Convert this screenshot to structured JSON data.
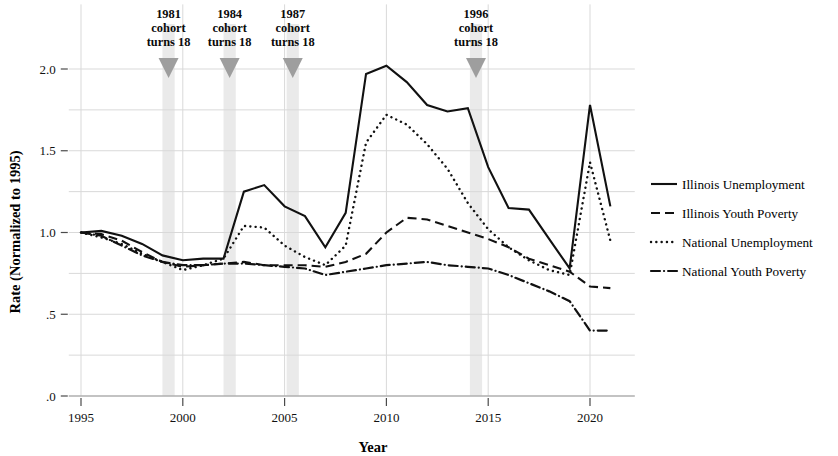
{
  "chart_data": {
    "type": "line",
    "title": "",
    "xlabel": "Year",
    "ylabel": "Rate (Normalized to 1995)",
    "xlim": [
      1994.4,
      2022.2
    ],
    "ylim": [
      0.0,
      2.12
    ],
    "grid": true,
    "legend_position": "right",
    "x_ticks": [
      "1995",
      "2000",
      "2005",
      "2010",
      "2015",
      "2020"
    ],
    "x_tick_values": [
      1995,
      2000,
      2005,
      2010,
      2015,
      2020
    ],
    "y_ticks": [
      ".0",
      ".5",
      "1.0",
      "1.5",
      "2.0"
    ],
    "y_tick_values": [
      0.0,
      0.5,
      1.0,
      1.5,
      2.0
    ],
    "y_gridline_values": [
      0.0,
      0.25,
      0.5,
      0.75,
      1.0,
      1.25,
      1.5,
      1.75,
      2.0
    ],
    "x": [
      1995,
      1996,
      1997,
      1998,
      1999,
      2000,
      2001,
      2002,
      2003,
      2004,
      2005,
      2006,
      2007,
      2008,
      2009,
      2010,
      2011,
      2012,
      2013,
      2014,
      2015,
      2016,
      2017,
      2018,
      2019,
      2020,
      2021
    ],
    "series": [
      {
        "name": "Illinois Unemployment",
        "style": "solid",
        "values": [
          1.0,
          1.01,
          0.98,
          0.93,
          0.86,
          0.83,
          0.84,
          0.84,
          1.25,
          1.29,
          1.16,
          1.1,
          0.91,
          1.12,
          1.97,
          2.02,
          1.92,
          1.78,
          1.74,
          1.76,
          1.4,
          1.15,
          1.14,
          0.96,
          0.78,
          1.78,
          1.16
        ]
      },
      {
        "name": "Illinois Youth Poverty",
        "style": "dashed",
        "values": [
          1.0,
          0.99,
          0.95,
          0.88,
          0.82,
          0.79,
          0.8,
          0.81,
          0.82,
          0.8,
          0.8,
          0.8,
          0.79,
          0.82,
          0.87,
          1.0,
          1.09,
          1.08,
          1.04,
          1.0,
          0.96,
          0.91,
          0.84,
          0.8,
          0.76,
          0.67,
          0.66
        ]
      },
      {
        "name": "National Unemployment",
        "style": "dotted",
        "values": [
          1.0,
          0.97,
          0.93,
          0.87,
          0.82,
          0.77,
          0.8,
          0.84,
          1.04,
          1.03,
          0.92,
          0.85,
          0.8,
          0.92,
          1.55,
          1.72,
          1.66,
          1.54,
          1.39,
          1.18,
          1.02,
          0.91,
          0.83,
          0.77,
          0.74,
          1.43,
          0.95
        ]
      },
      {
        "name": "National Youth Poverty",
        "style": "dashdot",
        "values": [
          1.0,
          0.98,
          0.92,
          0.86,
          0.82,
          0.8,
          0.8,
          0.81,
          0.81,
          0.8,
          0.79,
          0.78,
          0.74,
          0.76,
          0.78,
          0.8,
          0.81,
          0.82,
          0.8,
          0.79,
          0.78,
          0.74,
          0.69,
          0.64,
          0.58,
          0.4,
          0.4
        ]
      }
    ],
    "annotations": [
      {
        "label_year": "1981",
        "line2": "cohort",
        "line3": "turns 18",
        "band_year": 1999.3,
        "band_width_years": 0.6
      },
      {
        "label_year": "1984",
        "line2": "cohort",
        "line3": "turns 18",
        "band_year": 2002.3,
        "band_width_years": 0.6
      },
      {
        "label_year": "1987",
        "line2": "cohort",
        "line3": "turns 18",
        "band_year": 2005.4,
        "band_width_years": 0.6
      },
      {
        "label_year": "1996",
        "line2": "cohort",
        "line3": "turns 18",
        "band_year": 2014.4,
        "band_width_years": 0.6
      }
    ]
  },
  "colors": {
    "line": "#111111",
    "grid": "#d9d9d9",
    "axis": "#9a9a9a",
    "band": "#eaeaea",
    "marker": "#9e9e9e",
    "background": "#ffffff"
  },
  "legend": {
    "items": [
      {
        "label": "Illinois Unemployment",
        "style": "solid"
      },
      {
        "label": "Illinois Youth Poverty",
        "style": "dashed"
      },
      {
        "label": "National Unemployment",
        "style": "dotted"
      },
      {
        "label": "National Youth Poverty",
        "style": "dashdot"
      }
    ]
  }
}
